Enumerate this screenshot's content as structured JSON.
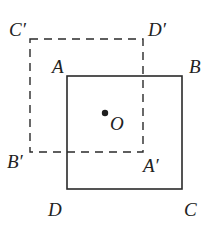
{
  "diagram": {
    "type": "geometry-figure",
    "colors": {
      "stroke": "#2a2a2a",
      "text": "#222222",
      "background": "#ffffff"
    },
    "center": {
      "label": "O",
      "x": 105,
      "y": 113
    },
    "solid_square": {
      "name": "ABCD",
      "x1": 67,
      "y1": 76,
      "x2": 182,
      "y2": 189,
      "vertices": {
        "A": {
          "label": "A",
          "lx": 53,
          "ly": 72
        },
        "B": {
          "label": "B",
          "lx": 188,
          "ly": 72
        },
        "C": {
          "label": "C",
          "lx": 184,
          "ly": 213
        },
        "D": {
          "label": "D",
          "lx": 49,
          "ly": 213
        }
      }
    },
    "dashed_square": {
      "name": "A'B'C'D'",
      "x1": 30,
      "y1": 39,
      "x2": 143,
      "y2": 152,
      "vertices": {
        "C_prime": {
          "label": "C′",
          "lx": 10,
          "ly": 35
        },
        "D_prime": {
          "label": "D′",
          "lx": 148,
          "ly": 35
        },
        "B_prime": {
          "label": "B′",
          "lx": 8,
          "ly": 166
        },
        "A_prime": {
          "label": "A′",
          "lx": 143,
          "ly": 166
        }
      }
    }
  }
}
